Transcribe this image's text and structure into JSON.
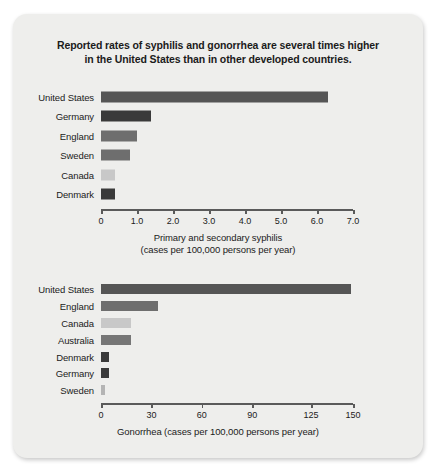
{
  "figure": {
    "title_line1": "Reported rates of syphilis and gonorrhea are several times higher",
    "title_line2": "in the United States than in other developed countries.",
    "card_color": "#eeeeec"
  },
  "chart_data": [
    {
      "type": "bar",
      "orientation": "horizontal",
      "title": "Reported rates of syphilis and gonorrhea are several times higher in the United States than in other developed countries.",
      "xlabel_line1": "Primary and secondary syphilis",
      "xlabel_line2": "(cases per 100,000 persons per year)",
      "ylabel": "",
      "categories": [
        "United States",
        "Germany",
        "England",
        "Sweden",
        "Canada",
        "Denmark"
      ],
      "values": [
        6.3,
        1.4,
        1.0,
        0.8,
        0.38,
        0.38
      ],
      "bar_colors": [
        "#555555",
        "#3a3a3a",
        "#6e6e6e",
        "#6e6e6e",
        "#c8c8c8",
        "#3a3a3a"
      ],
      "xlim": [
        0,
        7.0
      ],
      "ticks": [
        0,
        1.0,
        2.0,
        3.0,
        4.0,
        5.0,
        6.0,
        7.0
      ],
      "tick_labels": [
        "0",
        "1.0",
        "2.0",
        "3.0",
        "4.0",
        "5.0",
        "6.0",
        "7.0"
      ],
      "grid": false,
      "legend": "none"
    },
    {
      "type": "bar",
      "orientation": "horizontal",
      "xlabel_line1": "Gonorrhea (cases per 100,000 persons per year)",
      "xlabel_line2": "",
      "ylabel": "",
      "categories": [
        "United States",
        "England",
        "Canada",
        "Australia",
        "Denmark",
        "Germany",
        "Sweden"
      ],
      "values": [
        149,
        34,
        18,
        18,
        5,
        5,
        2.5
      ],
      "bar_colors": [
        "#555555",
        "#6e6e6e",
        "#c8c8c8",
        "#767676",
        "#3a3a3a",
        "#3a3a3a",
        "#b4b4b4"
      ],
      "xlim": [
        0,
        150
      ],
      "ticks": [
        0,
        30,
        60,
        90,
        125,
        150
      ],
      "tick_labels": [
        "0",
        "30",
        "60",
        "90",
        "125",
        "150"
      ],
      "grid": false,
      "legend": "none"
    }
  ]
}
